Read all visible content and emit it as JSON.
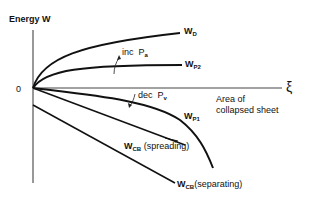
{
  "axes": {
    "y_label": "Energy  W",
    "origin_label": "0",
    "x_symbol": "ξ",
    "x_label_line1": "Area of",
    "x_label_line2": "collapsed sheet"
  },
  "curves": [
    {
      "id": "W_D",
      "main": "W",
      "sub": "D"
    },
    {
      "id": "W_P2",
      "main": "W",
      "sub": "P2"
    },
    {
      "id": "W_P1",
      "main": "W",
      "sub": "P1"
    },
    {
      "id": "W_CB_spreading",
      "main": "W",
      "sub": "CB",
      "suffix": "(spreading)"
    },
    {
      "id": "W_CB_separating",
      "main": "W",
      "sub": "CB",
      "suffix": "(separating)"
    }
  ],
  "annotations": {
    "inc": {
      "text": "inc",
      "var": "P",
      "sub": "a"
    },
    "dec": {
      "text": "dec",
      "var": "P",
      "sub": "v"
    }
  }
}
